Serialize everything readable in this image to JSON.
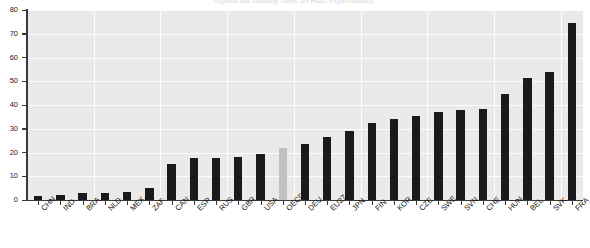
{
  "chart_data": {
    "type": "bar",
    "title": "Implied tax subsidy rates on R&D expenditures",
    "xlabel": "",
    "ylabel": "",
    "ylim": [
      0,
      80
    ],
    "yticks": [
      0,
      10,
      20,
      30,
      40,
      50,
      60,
      70,
      80
    ],
    "grid": true,
    "legend": "none",
    "categories": [
      "CHN",
      "IND",
      "BRA",
      "NLD",
      "MEX",
      "ZAF",
      "CAN",
      "ESP",
      "RUS",
      "GBR",
      "USA",
      "OECD",
      "DEU",
      "EU27",
      "JPN",
      "FIN",
      "KOR",
      "CZE",
      "SWE",
      "SVN",
      "CHE",
      "HUN",
      "BEL",
      "SVK",
      "FRA"
    ],
    "values": [
      1.5,
      2.0,
      3.0,
      3.0,
      3.5,
      5.0,
      15.0,
      17.5,
      17.5,
      18.0,
      19.5,
      22.0,
      23.5,
      26.5,
      29.0,
      32.5,
      34.0,
      35.5,
      37.0,
      38.0,
      38.5,
      44.5,
      51.5,
      54.0,
      74.5
    ],
    "bar_colors": [
      "#1a1a1a",
      "#1a1a1a",
      "#1a1a1a",
      "#1a1a1a",
      "#1a1a1a",
      "#1a1a1a",
      "#1a1a1a",
      "#1a1a1a",
      "#1a1a1a",
      "#1a1a1a",
      "#1a1a1a",
      "#c0c0c0",
      "#1a1a1a",
      "#1a1a1a",
      "#1a1a1a",
      "#1a1a1a",
      "#1a1a1a",
      "#1a1a1a",
      "#1a1a1a",
      "#1a1a1a",
      "#1a1a1a",
      "#1a1a1a",
      "#1a1a1a",
      "#1a1a1a",
      "#1a1a1a"
    ],
    "highlight_category": "OECD",
    "colors": {
      "bar_default": "#1a1a1a",
      "bar_highlight": "#c0c0c0",
      "plot_background": "#eaeaea",
      "gridline": "#fdfdfd",
      "axis": "#3a3a3a",
      "text": "#111111",
      "page_background": "#ffffff"
    }
  }
}
